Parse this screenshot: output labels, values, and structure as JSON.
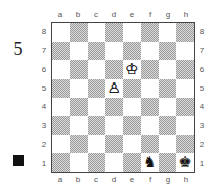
{
  "diagram": {
    "number": "5",
    "side_to_move": "black",
    "side_to_move_color": "#111111"
  },
  "board": {
    "files": [
      "a",
      "b",
      "c",
      "d",
      "e",
      "f",
      "g",
      "h"
    ],
    "ranks": [
      "8",
      "7",
      "6",
      "5",
      "4",
      "3",
      "2",
      "1"
    ],
    "light_square_color": "#ffffff",
    "dark_square_color": "#b0b0b0",
    "pieces": [
      {
        "square": "e6",
        "piece": "king",
        "color": "white",
        "glyph": "♔",
        "icon": "white-king-icon"
      },
      {
        "square": "d5",
        "piece": "pawn",
        "color": "white",
        "glyph": "♙",
        "icon": "white-pawn-icon"
      },
      {
        "square": "f1",
        "piece": "knight",
        "color": "black",
        "glyph": "♞",
        "icon": "black-knight-icon"
      },
      {
        "square": "h1",
        "piece": "king",
        "color": "black",
        "glyph": "♚",
        "icon": "black-king-icon"
      }
    ]
  }
}
